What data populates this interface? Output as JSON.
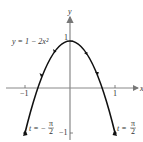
{
  "figure": {
    "equation_label": "y = 1 − 2x²",
    "axes": {
      "x_label": "x",
      "y_label": "y",
      "x_ticks": [
        {
          "value": -1,
          "label": "−1"
        },
        {
          "value": 1,
          "label": "1"
        }
      ],
      "y_ticks": [
        {
          "value": 1,
          "label": "1"
        },
        {
          "value": -1,
          "label": "−1"
        }
      ]
    },
    "endpoint_labels": {
      "left": {
        "prefix": "t = −",
        "num": "π",
        "den": "2"
      },
      "right": {
        "prefix": "t = ",
        "num": "π",
        "den": "2"
      }
    },
    "colors": {
      "curve": "#111111",
      "axis": "#888888",
      "text": "#333333"
    }
  }
}
